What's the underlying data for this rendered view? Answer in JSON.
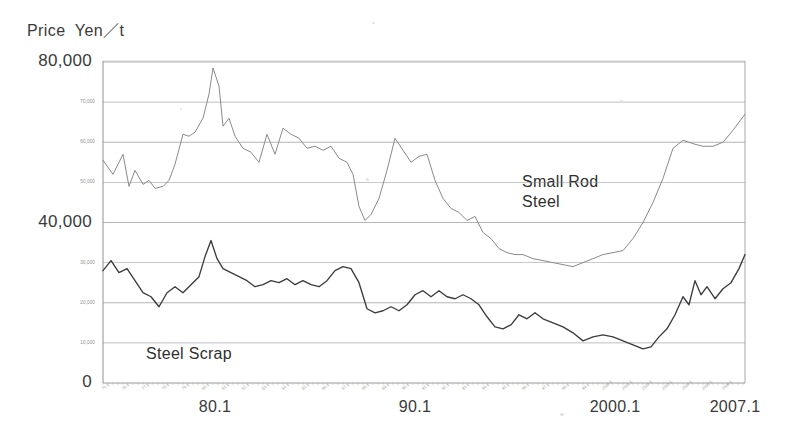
{
  "axis_title": "Price  Yen／t",
  "colors": {
    "background": "#ffffff",
    "axis": "#9a9a9a",
    "grid": "#8c8c96",
    "small_rod_steel": "#8a8a8a",
    "steel_scrap": "#3c3c3c",
    "text": "#3a3a3a",
    "minor_label": "#8d8d8d"
  },
  "y_axis": {
    "label_major": [
      "80,000",
      "40,000",
      "0"
    ],
    "label_minor": [
      "70,000",
      "60,000",
      "50,000",
      "30,000",
      "20,000",
      "10,000"
    ],
    "min": 0,
    "max": 80000,
    "tick_step": 10000,
    "grid": true
  },
  "x_axis": {
    "label_major": [
      "80.1",
      "90.1",
      "2000.1",
      "2007.1"
    ],
    "label_minor_sample": "76.1",
    "grid": false,
    "min_label": "80.1",
    "max_label": "2007.1"
  },
  "annotations": [
    {
      "name": "small-rod-steel-label",
      "text": "Small Rod\nSteel",
      "x": 522,
      "y": 172
    },
    {
      "name": "steel-scrap-label",
      "text": "Steel Scrap",
      "x": 146,
      "y": 344
    }
  ],
  "chart_data": {
    "type": "line",
    "title": "Price  Yen／t",
    "xlabel": "",
    "ylabel": "Price Yen/t",
    "ylim": [
      0,
      80000
    ],
    "xlim": [
      1975.0,
      2007.1
    ],
    "grid": true,
    "legend_position": "inline-annotation",
    "tick_labels_x": [
      "80.1",
      "90.1",
      "2000.1",
      "2007.1"
    ],
    "tick_labels_y": [
      "0",
      "10,000",
      "20,000",
      "30,000",
      "40,000",
      "50,000",
      "60,000",
      "70,000",
      "80,000"
    ],
    "series": [
      {
        "name": "Small Rod Steel",
        "color": "#8a8a8a",
        "x": [
          1975.0,
          1975.5,
          1976.0,
          1976.3,
          1976.6,
          1977.0,
          1977.3,
          1977.6,
          1978.0,
          1978.3,
          1978.6,
          1979.0,
          1979.3,
          1979.6,
          1980.0,
          1980.3,
          1980.5,
          1980.8,
          1981.0,
          1981.3,
          1981.6,
          1982.0,
          1982.4,
          1982.8,
          1983.2,
          1983.6,
          1984.0,
          1984.4,
          1984.8,
          1985.2,
          1985.6,
          1986.0,
          1986.4,
          1986.8,
          1987.2,
          1987.5,
          1987.8,
          1988.1,
          1988.4,
          1988.8,
          1989.2,
          1989.6,
          1990.0,
          1990.4,
          1990.8,
          1991.2,
          1991.6,
          1992.0,
          1992.4,
          1992.8,
          1993.2,
          1993.6,
          1994.0,
          1994.4,
          1994.8,
          1995.2,
          1995.6,
          1996.0,
          1996.5,
          1997.0,
          1997.5,
          1998.0,
          1998.5,
          1999.0,
          1999.5,
          2000.0,
          2000.5,
          2001.0,
          2001.5,
          2002.0,
          2002.5,
          2003.0,
          2003.5,
          2004.0,
          2004.3,
          2004.6,
          2005.0,
          2005.5,
          2006.0,
          2006.5,
          2007.1
        ],
        "y": [
          55500,
          52000,
          57000,
          49000,
          53000,
          49500,
          50500,
          48500,
          49000,
          50500,
          54500,
          62000,
          61500,
          62500,
          66000,
          72000,
          78500,
          74000,
          64000,
          66000,
          61500,
          58500,
          57500,
          55000,
          62000,
          57000,
          63500,
          62000,
          61000,
          58500,
          59000,
          58000,
          59000,
          56000,
          55000,
          52000,
          44000,
          40500,
          42000,
          46000,
          53000,
          61000,
          58000,
          55000,
          56500,
          57000,
          50500,
          46000,
          43500,
          42500,
          40500,
          41500,
          37500,
          36000,
          33500,
          32500,
          32000,
          32000,
          31000,
          30500,
          30000,
          29500,
          29000,
          30000,
          31000,
          32000,
          32500,
          33000,
          36000,
          40000,
          45000,
          51000,
          58500,
          60500,
          60000,
          59500,
          59000,
          59000,
          60000,
          63000,
          67000
        ]
      },
      {
        "name": "Steel Scrap",
        "color": "#3c3c3c",
        "x": [
          1975.0,
          1975.4,
          1975.8,
          1976.2,
          1976.6,
          1977.0,
          1977.4,
          1977.8,
          1978.2,
          1978.6,
          1979.0,
          1979.4,
          1979.8,
          1980.1,
          1980.4,
          1980.7,
          1981.0,
          1981.4,
          1981.8,
          1982.2,
          1982.6,
          1983.0,
          1983.4,
          1983.8,
          1984.2,
          1984.6,
          1985.0,
          1985.4,
          1985.8,
          1986.2,
          1986.6,
          1987.0,
          1987.4,
          1987.8,
          1988.2,
          1988.6,
          1989.0,
          1989.4,
          1989.8,
          1990.2,
          1990.6,
          1991.0,
          1991.4,
          1991.8,
          1992.2,
          1992.6,
          1993.0,
          1993.4,
          1993.8,
          1994.2,
          1994.6,
          1995.0,
          1995.4,
          1995.8,
          1996.2,
          1996.6,
          1997.0,
          1997.5,
          1998.0,
          1998.5,
          1999.0,
          1999.5,
          2000.0,
          2000.5,
          2001.0,
          2001.5,
          2002.0,
          2002.4,
          2002.8,
          2003.2,
          2003.6,
          2004.0,
          2004.3,
          2004.6,
          2004.9,
          2005.2,
          2005.6,
          2006.0,
          2006.4,
          2006.8,
          2007.1
        ],
        "y": [
          28000,
          30500,
          27500,
          28500,
          25500,
          22500,
          21500,
          19000,
          22500,
          24000,
          22500,
          24500,
          26500,
          31500,
          35500,
          31000,
          28500,
          27500,
          26500,
          25500,
          24000,
          24500,
          25500,
          25000,
          26000,
          24500,
          25500,
          24500,
          24000,
          25500,
          28000,
          29000,
          28500,
          25000,
          18500,
          17500,
          18000,
          19000,
          18000,
          19500,
          22000,
          23000,
          21500,
          23000,
          21500,
          21000,
          22000,
          21000,
          19500,
          16500,
          14000,
          13500,
          14500,
          17000,
          16000,
          17500,
          16000,
          15000,
          14000,
          12500,
          10500,
          11500,
          12000,
          11500,
          10500,
          9500,
          8500,
          9000,
          11500,
          13500,
          17000,
          21500,
          19500,
          25500,
          22000,
          24000,
          21000,
          23500,
          25000,
          28500,
          32000
        ]
      }
    ]
  }
}
